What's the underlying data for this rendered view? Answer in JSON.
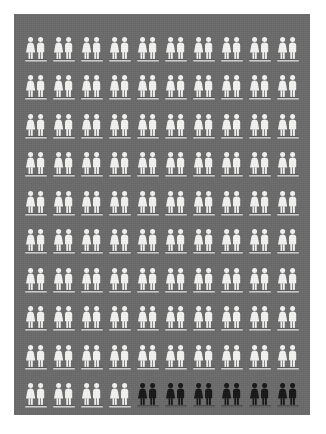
{
  "chart_data": {
    "type": "pictogram",
    "title": "",
    "subtitle": "",
    "xlabel": "",
    "ylabel": "",
    "unit_label": "pair of people",
    "unit_icon": "people-pair-icon",
    "grid": {
      "rows": 10,
      "columns": 10
    },
    "total_units": 100,
    "categories": [
      "Unhighlighted",
      "Highlighted"
    ],
    "values": [
      94,
      6
    ],
    "series": [
      {
        "name": "Unhighlighted",
        "value": 94,
        "percent": 94,
        "color": "#f4f4f2"
      },
      {
        "name": "Highlighted",
        "value": 6,
        "percent": 6,
        "color": "#151515"
      }
    ],
    "legend": [],
    "annotations": [],
    "fill_order": "row-major",
    "highlighted_cells": [
      {
        "row": 10,
        "column": 5
      },
      {
        "row": 10,
        "column": 6
      },
      {
        "row": 10,
        "column": 7
      },
      {
        "row": 10,
        "column": 8
      },
      {
        "row": 10,
        "column": 9
      },
      {
        "row": 10,
        "column": 10
      }
    ],
    "cells": [
      [
        "light",
        "light",
        "light",
        "light",
        "light",
        "light",
        "light",
        "light",
        "light",
        "light"
      ],
      [
        "light",
        "light",
        "light",
        "light",
        "light",
        "light",
        "light",
        "light",
        "light",
        "light"
      ],
      [
        "light",
        "light",
        "light",
        "light",
        "light",
        "light",
        "light",
        "light",
        "light",
        "light"
      ],
      [
        "light",
        "light",
        "light",
        "light",
        "light",
        "light",
        "light",
        "light",
        "light",
        "light"
      ],
      [
        "light",
        "light",
        "light",
        "light",
        "light",
        "light",
        "light",
        "light",
        "light",
        "light"
      ],
      [
        "light",
        "light",
        "light",
        "light",
        "light",
        "light",
        "light",
        "light",
        "light",
        "light"
      ],
      [
        "light",
        "light",
        "light",
        "light",
        "light",
        "light",
        "light",
        "light",
        "light",
        "light"
      ],
      [
        "light",
        "light",
        "light",
        "light",
        "light",
        "light",
        "light",
        "light",
        "light",
        "light"
      ],
      [
        "light",
        "light",
        "light",
        "light",
        "light",
        "light",
        "light",
        "light",
        "light",
        "light"
      ],
      [
        "light",
        "light",
        "light",
        "light",
        "dark",
        "dark",
        "dark",
        "dark",
        "dark",
        "dark"
      ]
    ]
  },
  "colors": {
    "panel_background": "#6a6a6a",
    "page_background": "#ffffff",
    "icon_light": "#f4f4f2",
    "icon_dark": "#151515",
    "baseline_light": "#ececeb",
    "baseline_dark": "#5f5f5f"
  },
  "icons": {
    "female": "female-figure-icon",
    "male": "male-figure-icon",
    "pair": "people-pair-icon",
    "baseline": "baseline-bar-icon"
  }
}
